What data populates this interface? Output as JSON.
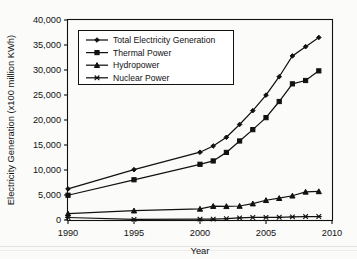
{
  "chart_data": {
    "type": "line",
    "title": "",
    "subtitle": "",
    "xlabel": "Year",
    "ylabel": "Electricity Generation (x100 million KWh)",
    "xlim": [
      1990,
      2010
    ],
    "ylim": [
      0,
      40000
    ],
    "xticks": [
      1990,
      1995,
      2000,
      2005,
      2010
    ],
    "xtick_labels": [
      "1990",
      "1995",
      "2000",
      "2005",
      "2010"
    ],
    "yticks": [
      0,
      5000,
      10000,
      15000,
      20000,
      25000,
      30000,
      35000,
      40000
    ],
    "ytick_labels": [
      "0",
      "5,000",
      "10,000",
      "15,000",
      "20,000",
      "25,000",
      "30,000",
      "35,000",
      "40,000"
    ],
    "grid": false,
    "legend_position": "upper-left-inside",
    "x": [
      1990,
      1995,
      2000,
      2001,
      2002,
      2003,
      2004,
      2005,
      2006,
      2007,
      2008,
      2009
    ],
    "series": [
      {
        "name": "Total Electricity Generation",
        "marker": "diamond",
        "values": [
          6212,
          10070,
          13556,
          14808,
          16540,
          19106,
          21870,
          24975,
          28657,
          32816,
          34669,
          36506
        ]
      },
      {
        "name": "Thermal Power",
        "marker": "square",
        "values": [
          4950,
          8046,
          11142,
          11811,
          13522,
          15803,
          18073,
          20473,
          23696,
          27229,
          27900,
          29828
        ]
      },
      {
        "name": "Hydropower",
        "marker": "triangle",
        "values": [
          1267,
          1868,
          2224,
          2774,
          2746,
          2800,
          3280,
          3952,
          4358,
          4853,
          5633,
          5717
        ]
      },
      {
        "name": "Nuclear Power",
        "marker": "cross",
        "values": [
          500,
          128,
          167,
          175,
          265,
          433,
          505,
          531,
          548,
          621,
          692,
          700
        ]
      }
    ],
    "annotations": []
  },
  "legend": {
    "entries": [
      {
        "label": "Total Electricity Generation",
        "marker": "diamond-marker-icon"
      },
      {
        "label": "Thermal Power",
        "marker": "square-marker-icon"
      },
      {
        "label": "Hydropower",
        "marker": "triangle-marker-icon"
      },
      {
        "label": "Nuclear Power",
        "marker": "cross-marker-icon"
      }
    ]
  },
  "colors": {
    "series_stroke": "#111111",
    "axis": "#111111",
    "background": "#fbfbfa",
    "legend_background": "#ffffff"
  }
}
